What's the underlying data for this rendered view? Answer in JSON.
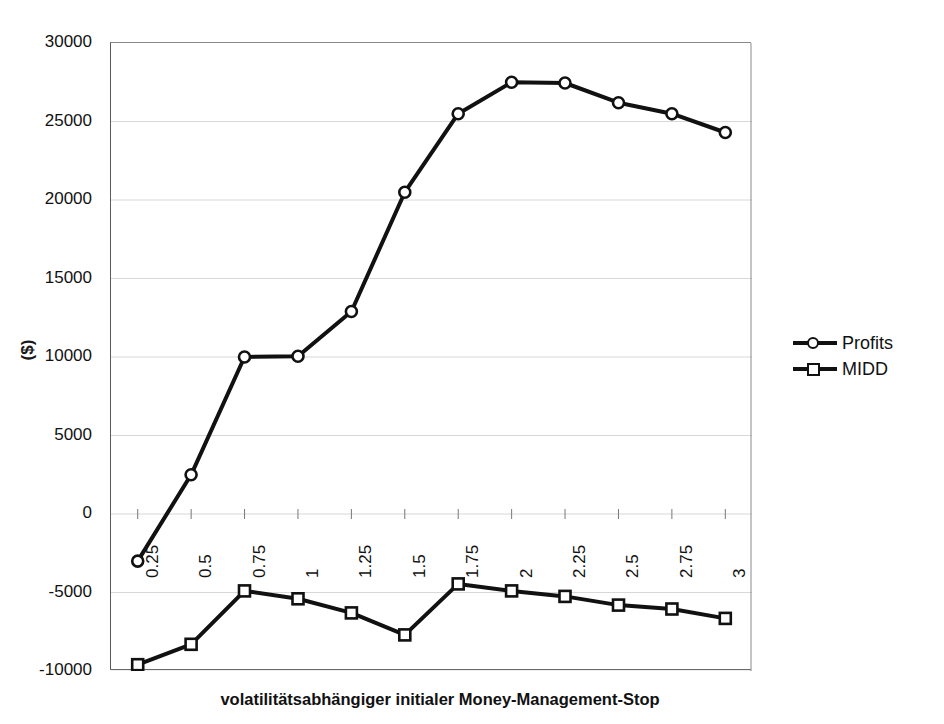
{
  "chart_data": {
    "type": "line",
    "title": "",
    "xlabel": "volatilitätsabhängiger initialer Money-Management-Stop",
    "ylabel": "($)",
    "categories": [
      "0.25",
      "0.5",
      "0.75",
      "1",
      "1.25",
      "1.5",
      "1.75",
      "2",
      "2.25",
      "2.5",
      "2.75",
      "3"
    ],
    "ylim": [
      -10000,
      30000
    ],
    "yticks": [
      "30000",
      "25000",
      "20000",
      "15000",
      "10000",
      "5000",
      "0",
      "-5000",
      "-10000"
    ],
    "ytick_values": [
      30000,
      25000,
      20000,
      15000,
      10000,
      5000,
      0,
      -5000,
      -10000
    ],
    "grid": true,
    "legend_position": "right",
    "series": [
      {
        "name": "Profits",
        "marker": "circle",
        "color": "#111111",
        "values": [
          -3000,
          2500,
          10000,
          10050,
          12900,
          20500,
          25500,
          27500,
          27450,
          26200,
          25500,
          24300
        ]
      },
      {
        "name": "MIDD",
        "marker": "square",
        "color": "#111111",
        "values": [
          -9600,
          -8300,
          -4900,
          -5400,
          -6300,
          -7700,
          -4450,
          -4900,
          -5250,
          -5800,
          -6050,
          -6650
        ]
      }
    ]
  },
  "legend": {
    "items": [
      {
        "label": "Profits",
        "marker": "circle"
      },
      {
        "label": "MIDD",
        "marker": "square"
      }
    ]
  }
}
